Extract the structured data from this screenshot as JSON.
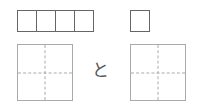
{
  "answer_boxes": {
    "left_count": 4,
    "right_count": 1
  },
  "writing_grids": {
    "left": {
      "guides": "dashed-cross"
    },
    "right": {
      "guides": "dashed-cross"
    }
  },
  "joiner_text": "と",
  "colors": {
    "box_border": "#666666",
    "grid_border": "#aaaaaa",
    "text": "#555555"
  }
}
